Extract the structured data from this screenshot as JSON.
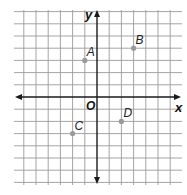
{
  "diagram": {
    "type": "coordinate-plane",
    "axes": {
      "x_label": "x",
      "y_label": "y",
      "origin_label": "O"
    },
    "grid": {
      "x_range": [
        -6,
        6
      ],
      "y_range": [
        -7,
        7
      ],
      "unit": 1
    },
    "points": [
      {
        "label": "A",
        "x": -1,
        "y": 3
      },
      {
        "label": "B",
        "x": 3,
        "y": 4
      },
      {
        "label": "C",
        "x": -2,
        "y": -3
      },
      {
        "label": "D",
        "x": 2,
        "y": -2
      }
    ],
    "colors": {
      "grid": "#9a9a9a",
      "axis": "#1a1a1a",
      "point": "#9a9a9a"
    }
  }
}
